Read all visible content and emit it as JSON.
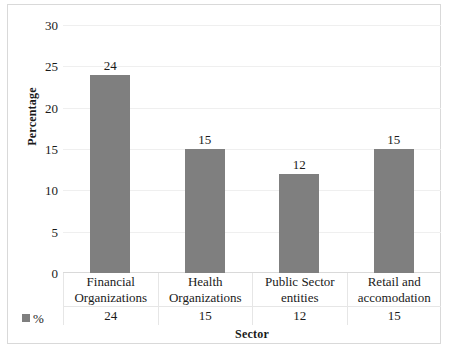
{
  "chart_data": {
    "type": "bar",
    "title": "",
    "xlabel": "Sector",
    "ylabel": "Percentage",
    "categories": [
      "Financial Organizations",
      "Health Organizations",
      "Public Sector entities",
      "Retail and accomodation"
    ],
    "category_lines": [
      [
        "Financial",
        "Organizations"
      ],
      [
        "Health",
        "Organizations"
      ],
      [
        "Public Sector",
        "entities"
      ],
      [
        "Retail and",
        "accomodation"
      ]
    ],
    "values": [
      24,
      15,
      12,
      15
    ],
    "value_labels": [
      "24",
      "15",
      "12",
      "15"
    ],
    "series": [
      {
        "name": "%",
        "values": [
          24,
          15,
          12,
          15
        ]
      }
    ],
    "ylim": [
      0,
      30
    ],
    "yticks": [
      0,
      5,
      10,
      15,
      20,
      25,
      30
    ],
    "ytick_labels": [
      "0",
      "5",
      "10",
      "15",
      "20",
      "25",
      "30"
    ],
    "grid": true,
    "legend_position": "bottom-left",
    "bar_color": "#7f7f7f",
    "data_table": {
      "legend_label": "%",
      "row_values": [
        "24",
        "15",
        "12",
        "15"
      ]
    }
  },
  "axis": {
    "y_title": "Percentage",
    "x_title": "Sector"
  },
  "legend": {
    "label": "%",
    "swatch_color": "#7f7f7f"
  }
}
